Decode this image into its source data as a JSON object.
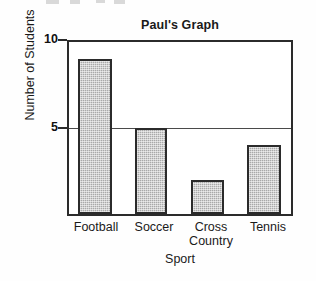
{
  "chart_data": {
    "type": "bar",
    "title": "Paul's Graph",
    "xlabel": "Sport",
    "ylabel": "Number of Students",
    "categories": [
      "Football",
      "Soccer",
      "Cross Country",
      "Tennis"
    ],
    "category_lines": [
      [
        "Football"
      ],
      [
        "Soccer"
      ],
      [
        "Cross",
        "Country"
      ],
      [
        "Tennis"
      ]
    ],
    "values": [
      9,
      5,
      2,
      4
    ],
    "ylim": [
      0,
      10
    ],
    "yticks": [
      5,
      10
    ],
    "ytick_labels": [
      "5",
      "10"
    ],
    "grid": "horizontal-at-5",
    "legend": "none",
    "bar_fill": "#a9a9a9",
    "bar_edge": "#2b2b2b",
    "axis_color": "#2b2b2b",
    "background": "#ffffff"
  },
  "axes": {
    "y_title": "Number of Students",
    "x_title": "Sport",
    "tick_10": "10",
    "tick_5": "5"
  },
  "bars": [
    {
      "label": "Football",
      "value": 9
    },
    {
      "label": "Soccer",
      "value": 5
    },
    {
      "label": "Cross Country",
      "value": 2
    },
    {
      "label": "Tennis",
      "value": 4
    }
  ],
  "x_tick_labels": {
    "football": "Football",
    "soccer": "Soccer",
    "cross": "Cross",
    "country": "Country",
    "tennis": "Tennis"
  }
}
